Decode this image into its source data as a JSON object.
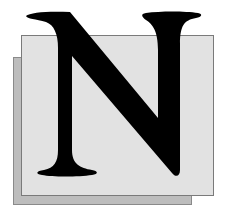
{
  "graphic": {
    "letter": "N",
    "colors": {
      "background": "#ffffff",
      "front_square": "#e2e2e2",
      "back_square": "#bdbdbd",
      "letter": "#000000"
    }
  }
}
